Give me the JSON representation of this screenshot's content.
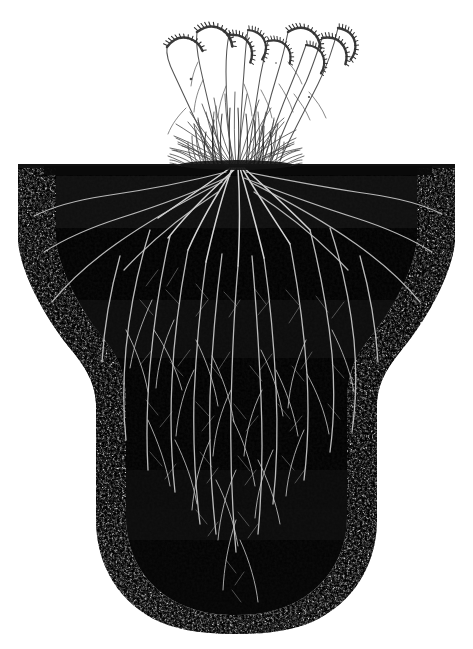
{
  "figure": {
    "domain_note": "monochrome stipple engraving, botanical plate",
    "width": 473,
    "height": 649,
    "background_color": "#ffffff",
    "caption": ""
  },
  "palette": {
    "paper": "#ffffff",
    "soil_core": "#0a0a0a",
    "soil_mid": "#161616",
    "soil_stipple": "#111111",
    "root_line": "#c9c9c9",
    "root_line_bright": "#e8e8e8",
    "shoot_ink": "#2b2b2b",
    "shoot_ink_light": "#565656",
    "seedhead_ink": "#3a3a3a"
  },
  "scene": {
    "soil_surface_y": 166,
    "soil_block": {
      "name": "soil-profile-block",
      "top_left_x": 18,
      "top_right_x": 455,
      "shoulder_y": 245,
      "waist_left_x": 103,
      "waist_right_x": 377,
      "waist_y": 400,
      "bottom_y": 632,
      "description": "wide flat-topped block that tapers to a rounded column"
    },
    "shoot": {
      "name": "grass-tuft",
      "base_left_x": 168,
      "base_right_x": 300,
      "base_y": 166,
      "tuft_top_y": 86,
      "leaf_count": 58,
      "culm_count": 9,
      "tallest_culm_top_y": 18
    },
    "seedheads": {
      "name": "nodding-spikelets",
      "count": 9,
      "positions": [
        {
          "x": 168,
          "y": 46,
          "angle": -34,
          "len": 30
        },
        {
          "x": 196,
          "y": 31,
          "angle": -18,
          "len": 33
        },
        {
          "x": 228,
          "y": 34,
          "angle": 12,
          "len": 30
        },
        {
          "x": 248,
          "y": 28,
          "angle": 24,
          "len": 28
        },
        {
          "x": 268,
          "y": 40,
          "angle": 6,
          "len": 26
        },
        {
          "x": 288,
          "y": 30,
          "angle": -14,
          "len": 31
        },
        {
          "x": 306,
          "y": 44,
          "angle": 22,
          "len": 27
        },
        {
          "x": 322,
          "y": 36,
          "angle": 8,
          "len": 30
        },
        {
          "x": 338,
          "y": 26,
          "angle": 28,
          "len": 29
        }
      ]
    },
    "roots": {
      "name": "root-system",
      "crown_x": 236,
      "crown_y": 168,
      "primary_count": 34,
      "max_depth_y": 612,
      "lateral_spread_x": [
        40,
        432
      ],
      "description": "dense white lines fanning from crown, spreading laterally near surface then descending"
    }
  },
  "labels": {
    "figure_label": "",
    "surface_label": "",
    "depth_label": ""
  }
}
